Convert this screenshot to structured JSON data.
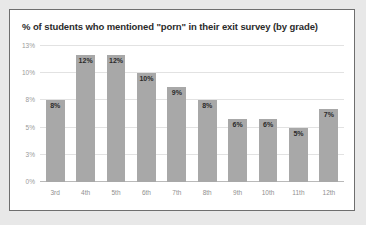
{
  "chart_data": {
    "type": "bar",
    "title": "% of students who mentioned \"porn\" in their exit survey (by grade)",
    "xlabel": "",
    "ylabel": "",
    "categories": [
      "3rd",
      "4th",
      "5th",
      "6th",
      "7th",
      "8th",
      "9th",
      "10th",
      "11th",
      "12th"
    ],
    "values": [
      8,
      12,
      12,
      10,
      9,
      8,
      6,
      6,
      5,
      7
    ],
    "value_labels": [
      "8%",
      "12%",
      "12%",
      "10%",
      "9%",
      "8%",
      "6%",
      "6%",
      "5%",
      "7%"
    ],
    "ylim": [
      0,
      13
    ],
    "yticks": [
      0,
      3,
      5,
      8,
      10,
      13
    ],
    "ytick_labels": [
      "0%",
      "3%",
      "5%",
      "8%",
      "10%",
      "13%"
    ],
    "grid": true,
    "legend": null,
    "colors": {
      "bar": "#a8a8a8",
      "gridline": "#e2e2e2",
      "baseline": "#b9b9b9",
      "title_text": "#2b2b2b",
      "value_text": "#2b2b2b",
      "tick_text": "#9a9a9a",
      "panel_background": "#ffffff",
      "page_background": "#e8e8e8",
      "border": "#6e6e6e"
    }
  }
}
